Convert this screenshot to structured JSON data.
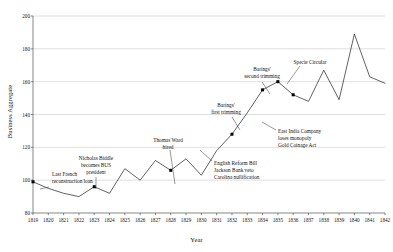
{
  "chart_data": {
    "type": "line",
    "title": "",
    "xlabel": "Year",
    "ylabel": "Business Aggregate",
    "xlim": [
      1819,
      1842
    ],
    "ylim": [
      80,
      200
    ],
    "yticks": [
      80,
      100,
      120,
      140,
      160,
      180,
      200
    ],
    "grid": true,
    "grid_axis": "y",
    "legend": "none",
    "line_color": "#3a3a3a",
    "marker_color": "#000000",
    "grid_color": "#bfbfbf",
    "axis_color": "#555555",
    "x": [
      1819,
      1820,
      1821,
      1822,
      1823,
      1824,
      1825,
      1826,
      1827,
      1828,
      1829,
      1830,
      1831,
      1832,
      1833,
      1834,
      1835,
      1836,
      1837,
      1838,
      1839,
      1840,
      1841,
      1842
    ],
    "values": [
      99,
      95,
      92,
      90,
      96,
      92,
      107,
      100,
      112,
      106,
      113,
      103,
      118,
      128,
      141,
      155,
      160,
      152,
      148,
      167,
      149,
      189,
      163,
      159
    ],
    "categories": [
      "1819",
      "1820",
      "1821",
      "1822",
      "1823",
      "1824",
      "1825",
      "1826",
      "1827",
      "1828",
      "1829",
      "1830",
      "1831",
      "1832",
      "1833",
      "1834",
      "1835",
      "1836",
      "1837",
      "1838",
      "1839",
      "1840",
      "1841",
      "1842"
    ],
    "xtick_labels": [
      "1819",
      "1820",
      "1821",
      "1822",
      "1823",
      "1824",
      "1825",
      "1826",
      "1827",
      "1828",
      "1829",
      "1830",
      "1831",
      "1832",
      "1833",
      "1834",
      "1835",
      "1836",
      "1837",
      "1838",
      "1839",
      "1840",
      "1841",
      "1842"
    ],
    "ytick_labels": [
      "80",
      "100",
      "120",
      "140",
      "160",
      "180",
      "200"
    ],
    "markers": [
      {
        "x": 1819,
        "y": 99
      },
      {
        "x": 1823,
        "y": 96
      },
      {
        "x": 1828,
        "y": 106
      },
      {
        "x": 1832,
        "y": 128
      },
      {
        "x": 1834,
        "y": 155
      },
      {
        "x": 1835,
        "y": 160
      },
      {
        "x": 1836,
        "y": 152
      }
    ],
    "annotations": [
      {
        "id": "last-french-loan",
        "lines": [
          "Last French",
          "reconstruction loan"
        ],
        "text_x": 52,
        "text_y": 171,
        "align": "left",
        "leader": {
          "x1": 49,
          "y1": 187,
          "x2": 40,
          "y2": 189
        }
      },
      {
        "id": "nicholas-biddle",
        "lines": [
          "Nicholas Biddle",
          "becomes BUS",
          "president"
        ],
        "text_x": 96,
        "text_y": 155,
        "align": "center",
        "leader": {
          "x1": 96,
          "y1": 177,
          "x2": 96,
          "y2": 189
        }
      },
      {
        "id": "thomas-ward-hired",
        "lines": [
          "Thomas Ward",
          "hired"
        ],
        "text_x": 168,
        "text_y": 137,
        "align": "center",
        "leader": {
          "x1": 170,
          "y1": 150,
          "x2": 175,
          "y2": 184
        }
      },
      {
        "id": "english-reform-bill",
        "lines": [
          "English Reform Bill",
          "Jackson Bank veto",
          "Carolina nullification"
        ],
        "text_x": 214,
        "text_y": 160,
        "align": "left",
        "leader": {
          "x1": 212,
          "y1": 161,
          "x2": 200,
          "y2": 150
        }
      },
      {
        "id": "barings-first-trimming",
        "lines": [
          "Barings'",
          "first trimming"
        ],
        "text_x": 226,
        "text_y": 102,
        "align": "center",
        "leader": {
          "x1": 232,
          "y1": 117,
          "x2": 240,
          "y2": 130
        }
      },
      {
        "id": "east-india-company",
        "lines": [
          "East India Company",
          "loses monopoly",
          "Gold Coinage Act"
        ],
        "text_x": 278,
        "text_y": 128,
        "align": "left",
        "leader": {
          "x1": 276,
          "y1": 130,
          "x2": 262,
          "y2": 122
        }
      },
      {
        "id": "barings-second-trimming",
        "lines": [
          "Barings'",
          "second trimming"
        ],
        "text_x": 262,
        "text_y": 66,
        "align": "center",
        "leader": {
          "x1": 262,
          "y1": 82,
          "x2": 270,
          "y2": 94
        }
      },
      {
        "id": "specie-circular",
        "lines": [
          "Specie Circular"
        ],
        "text_x": 310,
        "text_y": 59,
        "align": "center",
        "leader": {
          "x1": 300,
          "y1": 66,
          "x2": 287,
          "y2": 84
        }
      }
    ]
  }
}
